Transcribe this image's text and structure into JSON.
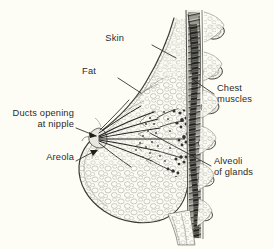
{
  "figure": {
    "kind": "anatomical-illustration",
    "background_color": "#fdfdf6",
    "ink_color": "#2b2b2b",
    "width": 274,
    "height": 249
  },
  "labels": [
    {
      "id": "skin",
      "text": "Skin",
      "lines": [
        "Skin"
      ],
      "align": "right",
      "x": 124,
      "y": 38,
      "leader": {
        "from": [
          152,
          45
        ],
        "to": [
          176,
          58
        ],
        "arrow": false
      }
    },
    {
      "id": "fat",
      "text": "Fat",
      "lines": [
        "Fat"
      ],
      "align": "right",
      "x": 96,
      "y": 71,
      "leader": {
        "from": [
          118,
          78
        ],
        "to": [
          141,
          93
        ],
        "arrow": false
      }
    },
    {
      "id": "ducts-opening-at-nipple",
      "text": "Ducts opening at nipple",
      "lines": [
        "Ducts opening",
        "at nipple"
      ],
      "align": "right",
      "x": 12,
      "y": 113,
      "leader": {
        "from": [
          76,
          128
        ],
        "to": [
          96,
          137
        ],
        "arrow": true
      }
    },
    {
      "id": "areola",
      "text": "Areola",
      "lines": [
        "Areola"
      ],
      "align": "right",
      "x": 43,
      "y": 157,
      "leader": {
        "from": [
          76,
          161
        ],
        "to": [
          98,
          150
        ],
        "arrow": true
      }
    },
    {
      "id": "chest-muscles",
      "text": "Chest muscles",
      "lines": [
        "Chest",
        "muscles"
      ],
      "align": "left",
      "x": 217,
      "y": 88,
      "leader": {
        "from": [
          214,
          94
        ],
        "to": [
          192,
          79
        ],
        "arrow": false
      }
    },
    {
      "id": "alveoli-of-glands",
      "text": "Alveoli of glands",
      "lines": [
        "Alveoli",
        "of glands"
      ],
      "align": "left",
      "x": 214,
      "y": 161,
      "leader": {
        "from": [
          211,
          166
        ],
        "to": [
          150,
          133
        ],
        "arrow": false
      }
    }
  ]
}
